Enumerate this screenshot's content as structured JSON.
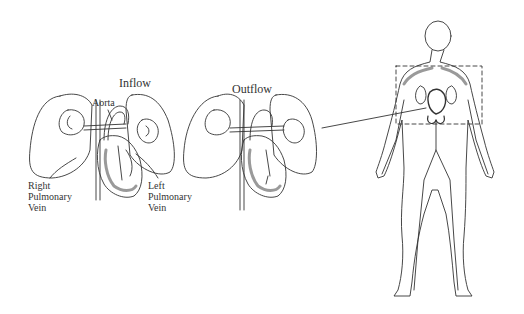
{
  "figure": {
    "panels": [
      {
        "id": "inflow",
        "title": "Inflow",
        "labels": {
          "aorta": "Aorta",
          "right_pulmonary_vein": [
            "Right",
            "Pulmonary",
            "Vein"
          ],
          "left_pulmonary_vein": [
            "Left",
            "Pulmonary",
            "Vein"
          ]
        }
      },
      {
        "id": "outflow",
        "title": "Outflow"
      },
      {
        "id": "body",
        "description": "Human body circulatory system with dashed region highlighting chest"
      }
    ],
    "colors": {
      "line": "#333333",
      "shade": "#9a9a9a",
      "background": "#ffffff"
    }
  }
}
